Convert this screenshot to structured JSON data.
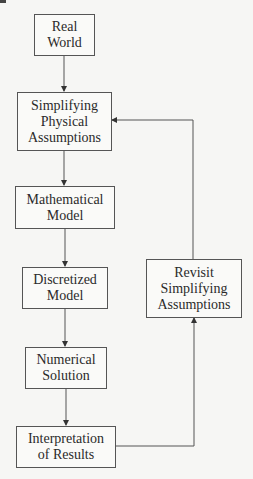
{
  "diagram": {
    "type": "flowchart",
    "nodes": [
      {
        "id": "real_world",
        "label": "Real\nWorld"
      },
      {
        "id": "simplifying",
        "label": "Simplifying\nPhysical\nAssumptions"
      },
      {
        "id": "mathematical",
        "label": "Mathematical\nModel"
      },
      {
        "id": "discretized",
        "label": "Discretized\nModel"
      },
      {
        "id": "numerical",
        "label": "Numerical\nSolution"
      },
      {
        "id": "interpretation",
        "label": "Interpretation\nof Results"
      },
      {
        "id": "revisit",
        "label": "Revisit\nSimplifying\nAssumptions"
      }
    ],
    "edges": [
      {
        "from": "real_world",
        "to": "simplifying"
      },
      {
        "from": "simplifying",
        "to": "mathematical"
      },
      {
        "from": "mathematical",
        "to": "discretized"
      },
      {
        "from": "discretized",
        "to": "numerical"
      },
      {
        "from": "numerical",
        "to": "interpretation"
      },
      {
        "from": "interpretation",
        "to": "revisit"
      },
      {
        "from": "revisit",
        "to": "simplifying"
      }
    ],
    "colors": {
      "line": "#555555",
      "text": "#2a2a2a",
      "background": "#f6f6f4"
    }
  }
}
